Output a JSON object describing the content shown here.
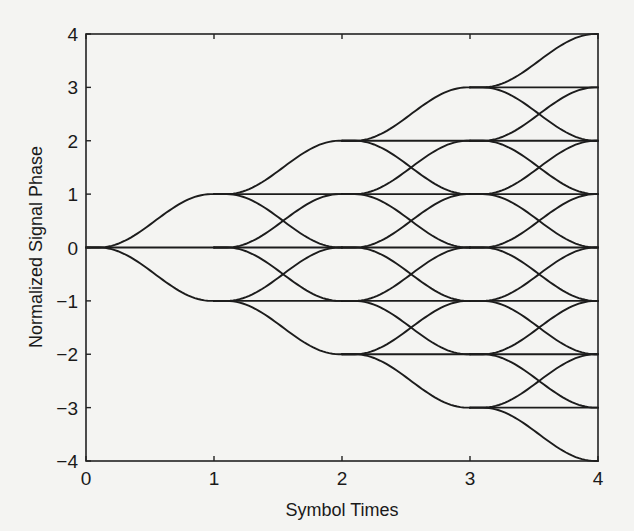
{
  "chart_data": {
    "type": "line",
    "subtype": "phase-trellis",
    "title": "",
    "xlabel": "Symbol Times",
    "ylabel": "Normalized Signal Phase",
    "xlim": [
      0,
      4
    ],
    "ylim": [
      -4,
      4
    ],
    "x_ticks": [
      0,
      1,
      2,
      3,
      4
    ],
    "x_tick_labels": [
      "0",
      "1",
      "2",
      "3",
      "4"
    ],
    "y_ticks": [
      4,
      3,
      2,
      1,
      0,
      -1,
      -2,
      -3,
      -4
    ],
    "y_tick_labels": [
      "4",
      "3",
      "2",
      "1",
      "0",
      "−1",
      "−2",
      "−3",
      "−4"
    ],
    "grid": false,
    "legend": null,
    "symbol_increments": [
      -1,
      0,
      1
    ],
    "start_phase": 0,
    "num_symbols": 4,
    "node_phases_by_time": [
      [
        0
      ],
      [
        -1,
        0,
        1
      ],
      [
        -2,
        -1,
        0,
        1,
        2
      ],
      [
        -3,
        -2,
        -1,
        0,
        1,
        2,
        3
      ],
      [
        -4,
        -3,
        -2,
        -1,
        0,
        1,
        2,
        3,
        4
      ]
    ],
    "transition_shape": "raised-cosine, starts ~0.1 symbol after each symbol time, settles by next symbol time",
    "line_color": "#1c1c1c"
  },
  "colors": {
    "background": "#f4f4f2",
    "ink": "#1c1c1c"
  }
}
